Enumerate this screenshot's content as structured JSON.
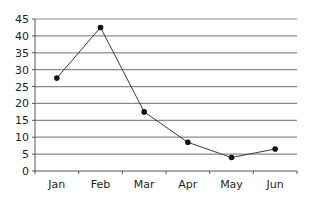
{
  "chart_data": {
    "type": "line",
    "title": "",
    "xlabel": "",
    "ylabel": "",
    "categories": [
      "Jan",
      "Feb",
      "Mar",
      "Apr",
      "May",
      "Jun"
    ],
    "series": [
      {
        "name": "Series 1",
        "values": [
          27.5,
          42.5,
          17.5,
          8.5,
          4,
          6.5
        ]
      }
    ],
    "ylim": [
      0,
      45
    ],
    "yticks": [
      0,
      5,
      10,
      15,
      20,
      25,
      30,
      35,
      40,
      45
    ],
    "grid": true,
    "legend": null,
    "colors": {
      "line": "#3a3a3a",
      "marker": "#111111",
      "grid": "#8a8a8a",
      "text": "#231f20"
    }
  }
}
